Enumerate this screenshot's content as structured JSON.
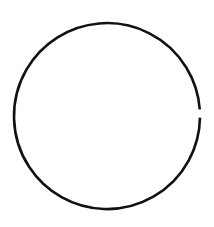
{
  "diagram": {
    "background": "#ffffff",
    "shape": {
      "type": "open-circle-arc",
      "center": [
        107,
        116
      ],
      "radius": 93,
      "stroke_color": "#111111",
      "stroke_width": 2.6,
      "gap": {
        "position": "right",
        "start_angle_deg": -4,
        "end_angle_deg": 1
      }
    }
  }
}
